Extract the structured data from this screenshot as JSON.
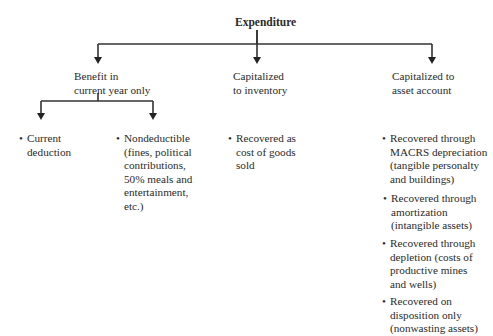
{
  "title": "Expenditure",
  "branches": [
    {
      "label_lines": [
        "Benefit in",
        "current year only"
      ],
      "children": [
        {
          "bullet": "•",
          "lines": [
            "Current",
            "deduction"
          ]
        },
        {
          "bullet": "•",
          "lines": [
            "Nondeductible",
            "(fines, political",
            "contributions,",
            "50% meals and",
            "entertainment,",
            "etc.)"
          ]
        }
      ]
    },
    {
      "label_lines": [
        "Capitalized",
        "to inventory"
      ],
      "items": [
        {
          "bullet": "•",
          "lines": [
            "Recovered as",
            "cost of goods",
            "sold"
          ]
        }
      ]
    },
    {
      "label_lines": [
        "Capitalized to",
        "asset account"
      ],
      "items": [
        {
          "bullet": "•",
          "lines": [
            "Recovered through",
            "MACRS depreciation",
            "(tangible personalty",
            "and buildings)"
          ]
        },
        {
          "bullet": "•",
          "lines": [
            "Recovered through",
            "amortization",
            "(intangible assets)"
          ]
        },
        {
          "bullet": "•",
          "lines": [
            "Recovered through",
            "depletion (costs of",
            "productive mines",
            "and wells)"
          ]
        },
        {
          "bullet": "•",
          "lines": [
            "Recovered on",
            "disposition only",
            "(nonwasting assets)"
          ]
        }
      ]
    }
  ]
}
